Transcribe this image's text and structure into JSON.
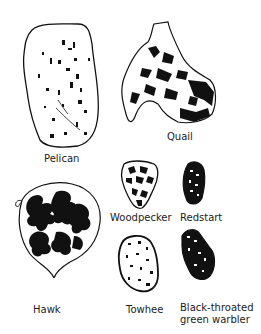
{
  "figure": {
    "specimens": [
      {
        "id": "pelican",
        "label": "Pelican"
      },
      {
        "id": "quail",
        "label": "Quail"
      },
      {
        "id": "hawk",
        "label": "Hawk"
      },
      {
        "id": "woodpecker",
        "label": "Woodpecker"
      },
      {
        "id": "redstart",
        "label": "Redstart"
      },
      {
        "id": "towhee",
        "label": "Towhee"
      },
      {
        "id": "warbler",
        "label_line1": "Black-throated",
        "label_line2": "green warbler"
      }
    ],
    "colors": {
      "ink": "#111111",
      "background": "#ffffff"
    }
  }
}
